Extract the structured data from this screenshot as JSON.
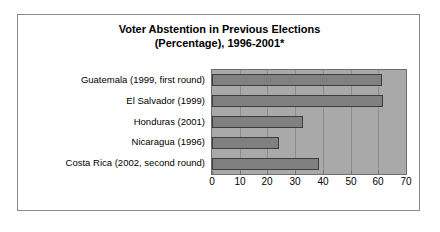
{
  "chart_data": {
    "type": "bar",
    "orientation": "horizontal",
    "title": "Voter Abstention in Previous Elections (Percentage), 1996-2001*",
    "title_line1": "Voter Abstention in Previous Elections",
    "title_line2": "(Percentage), 1996-2001*",
    "xlabel": "",
    "ylabel": "",
    "categories": [
      "Guatemala (1999, first round)",
      "El Salvador (1999)",
      "Honduras (2001)",
      "Nicaragua (1996)",
      "Costa Rica (2002, second round)"
    ],
    "values": [
      61.5,
      61.8,
      33,
      24,
      38.5
    ],
    "xlim": [
      0,
      70
    ],
    "xticks": [
      0,
      10,
      20,
      30,
      40,
      50,
      60,
      70
    ],
    "xtick_labels": [
      "0",
      "10",
      "20",
      "30",
      "40",
      "50",
      "60",
      "70"
    ],
    "grid": true,
    "legend": false,
    "colors": {
      "bar_fill": "#808080",
      "bar_outline": "#3d3d3d",
      "plot_background": "#a9a9a9",
      "gridline": "#8c8c8c",
      "frame_border": "#8a8a8a",
      "page_background": "#ffffff",
      "text": "#000000"
    }
  }
}
